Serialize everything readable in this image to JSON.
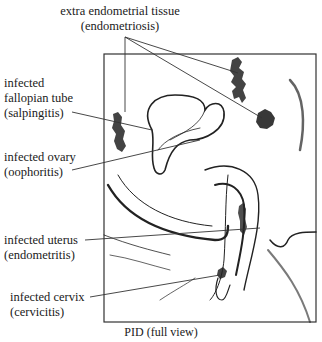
{
  "figure": {
    "caption": "PID (full view)",
    "labels": [
      {
        "id": "endometriosis",
        "line1": "extra endometrial tissue",
        "line2": "(endometriosis)"
      },
      {
        "id": "salpingitis",
        "line1": "infected",
        "line2": "fallopian tube",
        "line3": "(salpingitis)"
      },
      {
        "id": "oophoritis",
        "line1": "infected ovary",
        "line2": "(oophoritis)"
      },
      {
        "id": "endometritis",
        "line1": "infected uterus",
        "line2": "(endometritis)"
      },
      {
        "id": "cervicitis",
        "line1": "infected cervix",
        "line2": "(cervicitis)"
      }
    ],
    "colors": {
      "ink": "#1a1a1a",
      "background": "#ffffff",
      "frame": "#333333"
    }
  }
}
